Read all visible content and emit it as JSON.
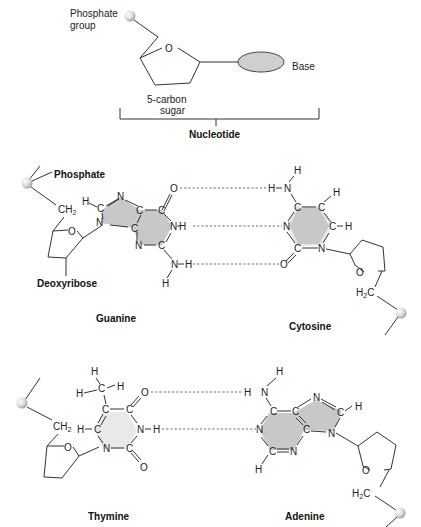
{
  "nucleotide": {
    "phosphate_label_line1": "Phosphate",
    "phosphate_label_line2": "group",
    "ring_oxygen": "O",
    "base_label": "Base",
    "sugar_label_line1": "5-carbon",
    "sugar_label_line2": "sugar",
    "bracket_label": "Nucleotide"
  },
  "pair_gc": {
    "phosphate_label": "Phosphate",
    "deoxyribose_label": "Deoxyribose",
    "left_base_name": "Guanine",
    "right_base_name": "Cytosine",
    "hydrogen_bonds": 3
  },
  "pair_at": {
    "left_base_name": "Thymine",
    "right_base_name": "Adenine",
    "hydrogen_bonds": 2
  },
  "atoms": {
    "C": "C",
    "N": "N",
    "O": "O",
    "H": "H",
    "CH2": "CH",
    "H2C": "H",
    "sub2": "2",
    "C_after": "C"
  },
  "colors": {
    "base_fill": "#c8c8c8",
    "pyrimidine_light_fill": "#e9e9e9",
    "phosphate_ball": "#dcdcdc"
  }
}
